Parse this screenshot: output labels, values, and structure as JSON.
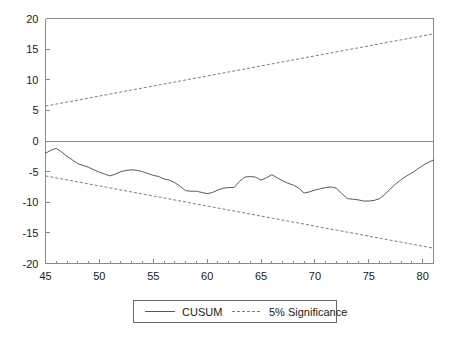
{
  "chart_data": {
    "type": "line",
    "title": "",
    "xlabel": "",
    "ylabel": "",
    "xlim": [
      45,
      81
    ],
    "ylim": [
      -20,
      20
    ],
    "yticks": [
      20,
      15,
      10,
      5,
      0,
      -5,
      -10,
      -15,
      -20
    ],
    "ytick_labels": [
      "20",
      "15",
      "10",
      "5",
      "0",
      "-5",
      "-10",
      "-15",
      "-20"
    ],
    "xticks": [
      45,
      50,
      55,
      60,
      65,
      70,
      75,
      80
    ],
    "xtick_labels": [
      "45",
      "50",
      "55",
      "60",
      "65",
      "70",
      "75",
      "80"
    ],
    "x_minor_tick_step": 1,
    "grid": false,
    "legend_position": "bottom-center",
    "zero_line": 0,
    "series": [
      {
        "name": "CUSUM",
        "style": "solid",
        "color": "#5a5a5a",
        "x": [
          45,
          45.5,
          46,
          46.5,
          47,
          47.5,
          48,
          48.5,
          49,
          49.5,
          50,
          50.5,
          51,
          51.5,
          52,
          52.5,
          53,
          53.5,
          54,
          54.5,
          55,
          55.5,
          56,
          56.5,
          57,
          57.5,
          58,
          58.5,
          59,
          59.5,
          60,
          60.5,
          61,
          61.5,
          62,
          62.5,
          63,
          63.5,
          64,
          64.5,
          65,
          65.5,
          66,
          66.5,
          67,
          67.5,
          68,
          68.5,
          69,
          69.5,
          70,
          70.5,
          71,
          71.5,
          72,
          72.5,
          73,
          73.5,
          74,
          74.5,
          75,
          75.5,
          76,
          76.5,
          77,
          77.5,
          78,
          78.5,
          79,
          79.5,
          80,
          80.5,
          81
        ],
        "y": [
          -2.0,
          -1.5,
          -1.2,
          -1.8,
          -2.5,
          -3.1,
          -3.7,
          -4.0,
          -4.3,
          -4.7,
          -5.1,
          -5.4,
          -5.7,
          -5.4,
          -5.0,
          -4.8,
          -4.7,
          -4.8,
          -5.0,
          -5.3,
          -5.6,
          -5.8,
          -6.2,
          -6.4,
          -6.8,
          -7.4,
          -8.1,
          -8.2,
          -8.2,
          -8.4,
          -8.6,
          -8.4,
          -8.0,
          -7.7,
          -7.6,
          -7.6,
          -6.6,
          -5.9,
          -5.8,
          -5.9,
          -6.4,
          -6.0,
          -5.5,
          -6.0,
          -6.5,
          -6.9,
          -7.2,
          -7.7,
          -8.5,
          -8.3,
          -8.0,
          -7.8,
          -7.6,
          -7.5,
          -7.7,
          -8.6,
          -9.4,
          -9.5,
          -9.6,
          -9.8,
          -9.8,
          -9.7,
          -9.4,
          -8.7,
          -7.8,
          -7.0,
          -6.3,
          -5.7,
          -5.2,
          -4.6,
          -4.0,
          -3.5,
          -3.1
        ]
      },
      {
        "name": "5% Significance",
        "style": "dashed",
        "color": "#6f6f6f",
        "x": [
          45,
          81
        ],
        "y": [
          5.7,
          17.5
        ]
      },
      {
        "name": "5% Significance Lower",
        "style": "dashed",
        "color": "#6f6f6f",
        "x": [
          45,
          81
        ],
        "y": [
          -5.7,
          -17.5
        ]
      }
    ],
    "legend": [
      {
        "label": "CUSUM",
        "style": "solid"
      },
      {
        "label": "5% Significance",
        "style": "dashed"
      }
    ]
  },
  "colors": {
    "background": "#ffffff",
    "axis": "#8a8a8a",
    "cusum": "#5a5a5a",
    "significance": "#6f6f6f",
    "text": "#1a1a1a"
  }
}
